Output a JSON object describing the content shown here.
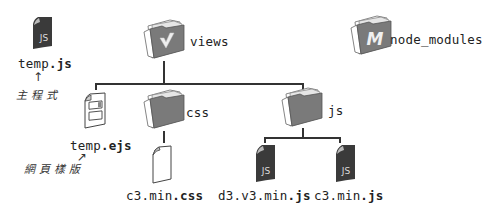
{
  "nodes": {
    "temp_js": {
      "name": "temp",
      "ext": ".js",
      "icon": "js-file-icon",
      "annotation": "主程式"
    },
    "views": {
      "name": "views",
      "icon": "folder-vue-icon",
      "glyph": "V"
    },
    "node_modules": {
      "name": "node_modules",
      "icon": "folder-node-icon",
      "glyph": "M"
    },
    "temp_ejs": {
      "name": "temp",
      "ext": ".ejs",
      "icon": "template-file-icon",
      "annotation": "網頁樣版"
    },
    "css": {
      "name": "css",
      "icon": "folder-icon"
    },
    "js": {
      "name": "js",
      "icon": "folder-icon"
    },
    "c3_min_css": {
      "name": "c3.min",
      "ext": ".css",
      "icon": "blank-file-icon"
    },
    "d3_v3_min_js": {
      "name": "d3.v3.min",
      "ext": ".js",
      "icon": "js-file-icon",
      "glyph": "JS"
    },
    "c3_min_js": {
      "name": "c3.min",
      "ext": ".js",
      "icon": "js-file-icon",
      "glyph": "JS"
    }
  },
  "js_glyph": "JS",
  "colors": {
    "folder": "#7a7a7a",
    "folder_dark": "#5e5e5e",
    "file_dark": "#3a3a3a",
    "line": "#333333"
  }
}
